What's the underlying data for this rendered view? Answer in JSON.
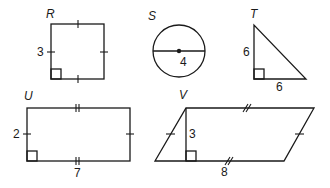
{
  "figures": [
    {
      "name": "R",
      "shape": "square",
      "labels": {
        "side": "3"
      }
    },
    {
      "name": "S",
      "shape": "circle",
      "labels": {
        "diameter": "4"
      }
    },
    {
      "name": "T",
      "shape": "right-triangle",
      "labels": {
        "leg_vertical": "6",
        "leg_horizontal": "6"
      }
    },
    {
      "name": "U",
      "shape": "rectangle",
      "labels": {
        "width": "2",
        "length": "7"
      }
    },
    {
      "name": "V",
      "shape": "parallelogram",
      "labels": {
        "height": "3",
        "base": "8"
      }
    }
  ],
  "colors": {
    "stroke": "#1a1a1a",
    "background": "#ffffff"
  }
}
